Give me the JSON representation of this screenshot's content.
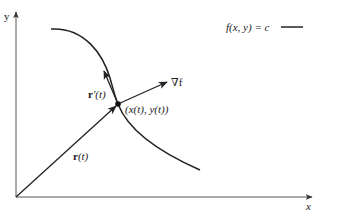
{
  "diagram": {
    "type": "gradient-orthogonal-to-level-curve",
    "axes": {
      "x_label": "x",
      "y_label": "y"
    },
    "legend": {
      "label": "f(x, y) = c",
      "line_color": "#222222"
    },
    "labels": {
      "gradient": "∇f",
      "point": "(x(t), y(t))",
      "position_vector_bold": "r",
      "position_vector_arg": "(t)",
      "tangent_vector_bold": "r",
      "tangent_vector_arg": "′(t)"
    },
    "colors": {
      "stroke": "#222222",
      "axis": "#555555",
      "background": "#ffffff"
    }
  }
}
